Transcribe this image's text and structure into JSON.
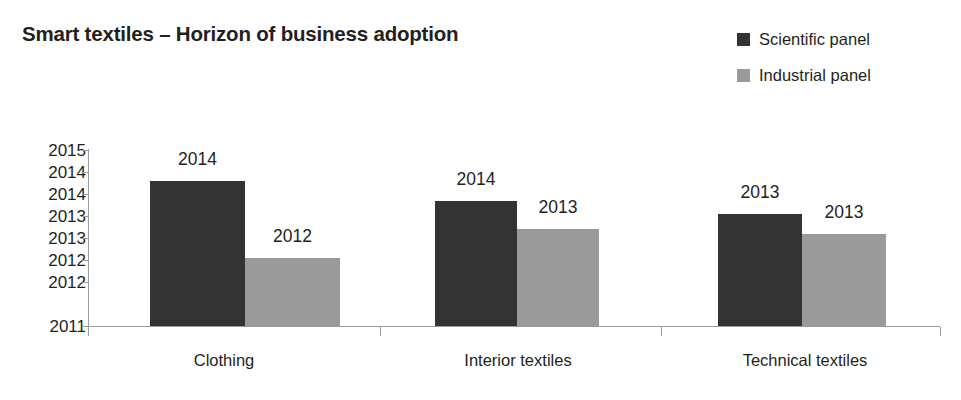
{
  "chart_data": {
    "type": "bar",
    "title": "Smart textiles – Horizon of business adoption",
    "xlabel": "",
    "ylabel": "",
    "ylim": [
      2011,
      2015
    ],
    "grid": false,
    "legend_position": "top-right",
    "categories": [
      "Clothing",
      "Interior textiles",
      "Technical textiles"
    ],
    "ytick_labels": [
      "2015",
      "2014",
      "2014",
      "2013",
      "2013",
      "2012",
      "2012",
      "2011"
    ],
    "ytick_values": [
      2015,
      2014.5,
      2014,
      2013.5,
      2013,
      2012.5,
      2012,
      2011
    ],
    "series": [
      {
        "name": "Scientific panel",
        "color": "#333333",
        "values": [
          2014.3,
          2013.85,
          2013.55
        ],
        "labels": [
          "2014",
          "2014",
          "2013"
        ]
      },
      {
        "name": "Industrial panel",
        "color": "#9a9a9a",
        "values": [
          2012.55,
          2013.2,
          2013.1
        ],
        "labels": [
          "2012",
          "2013",
          "2013"
        ]
      }
    ]
  },
  "axis": {
    "line_color": "#9c9c9c"
  }
}
